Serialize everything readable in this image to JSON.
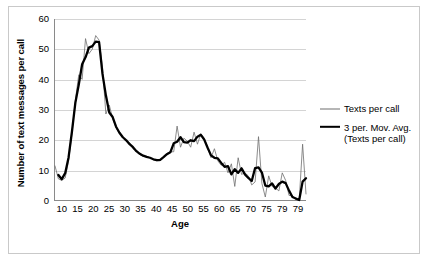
{
  "chart_data": {
    "type": "line",
    "title": "",
    "xlabel": "Age",
    "ylabel": "Number of text messages per call",
    "xlim": [
      10,
      84
    ],
    "ylim": [
      0,
      60
    ],
    "grid": true,
    "legend_position": "right",
    "y_ticks": [
      0,
      10,
      20,
      30,
      40,
      50,
      60
    ],
    "x_ticks": [
      10,
      15,
      20,
      25,
      30,
      35,
      40,
      45,
      50,
      55,
      60,
      65,
      70,
      75,
      79,
      79
    ],
    "x_tick_labels": [
      "10",
      "15",
      "20",
      "25",
      "30",
      "35",
      "40",
      "45",
      "50",
      "55",
      "60",
      "65",
      "70",
      "75",
      "79",
      "79"
    ],
    "x": [
      10,
      11,
      12,
      13,
      14,
      15,
      16,
      17,
      18,
      19,
      20,
      21,
      22,
      23,
      24,
      25,
      26,
      27,
      28,
      29,
      30,
      31,
      32,
      33,
      34,
      35,
      36,
      37,
      38,
      39,
      40,
      41,
      42,
      43,
      44,
      45,
      46,
      47,
      48,
      49,
      50,
      51,
      52,
      53,
      54,
      55,
      56,
      57,
      58,
      59,
      60,
      61,
      62,
      63,
      64,
      65,
      66,
      67,
      68,
      69,
      70,
      71,
      72,
      73,
      74,
      75,
      76,
      77,
      78,
      79,
      80,
      81,
      82,
      83,
      84
    ],
    "series": [
      {
        "name": "Texts per call",
        "style": "thin",
        "color": "#6e6e6e",
        "values": [
          11.3,
          7.0,
          6.5,
          7.3,
          13.0,
          22.0,
          33.0,
          41.5,
          40.0,
          53.5,
          48.5,
          50.0,
          54.5,
          53.0,
          44.0,
          28.5,
          31.5,
          27.0,
          24.0,
          22.0,
          21.0,
          19.5,
          19.0,
          17.0,
          16.5,
          15.0,
          14.5,
          14.5,
          14.0,
          13.5,
          13.0,
          13.0,
          14.0,
          15.5,
          16.0,
          16.0,
          24.5,
          17.5,
          20.5,
          19.5,
          17.5,
          22.5,
          18.5,
          22.0,
          20.5,
          17.5,
          14.0,
          17.0,
          13.0,
          11.5,
          12.5,
          9.0,
          12.0,
          4.5,
          14.0,
          8.5,
          9.0,
          8.0,
          5.0,
          6.0,
          21.0,
          5.5,
          1.0,
          8.0,
          4.5,
          4.0,
          3.0,
          9.0,
          6.5,
          1.5,
          1.5,
          0.0,
          0.0,
          18.5,
          2.0
        ]
      },
      {
        "name": "3 per. Mov. Avg. (Texts per call)",
        "style": "thick",
        "color": "#000000",
        "values": [
          null,
          8.3,
          6.9,
          8.9,
          14.1,
          22.7,
          32.2,
          38.2,
          45.0,
          47.3,
          50.5,
          51.0,
          52.5,
          52.3,
          41.8,
          34.7,
          29.0,
          27.5,
          24.3,
          22.3,
          20.8,
          19.8,
          18.5,
          17.5,
          16.2,
          15.3,
          14.7,
          14.3,
          14.0,
          13.5,
          13.2,
          13.3,
          14.2,
          15.2,
          15.8,
          18.8,
          19.3,
          20.8,
          19.2,
          19.0,
          19.8,
          19.5,
          21.0,
          21.6,
          20.0,
          17.3,
          14.8,
          14.0,
          13.8,
          12.3,
          11.0,
          11.2,
          8.5,
          10.2,
          9.0,
          10.5,
          8.5,
          7.3,
          6.3,
          10.6,
          10.8,
          9.1,
          4.8,
          4.5,
          5.5,
          3.8,
          5.3,
          6.1,
          5.6,
          3.1,
          1.0,
          0.5,
          0.0,
          6.1,
          7.2
        ]
      }
    ]
  },
  "legend": {
    "entries": [
      {
        "label": "Texts per call"
      },
      {
        "label": "3 per. Mov. Avg.\n(Texts per call)"
      }
    ]
  }
}
